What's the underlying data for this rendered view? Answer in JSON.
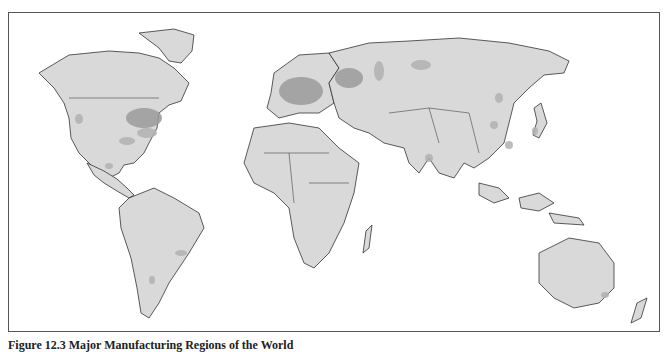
{
  "figure": {
    "caption": "Figure 12.3 Major Manufacturing Regions of the World",
    "type": "world map",
    "colors": {
      "land": "#d9d9d9",
      "manufacturing_major": "#9a9a9a",
      "manufacturing_minor": "#b0b0b0",
      "outline": "#333333",
      "water": "#ffffff"
    }
  },
  "regions": {
    "major": [
      "Northeastern United States / Great Lakes",
      "Western and Central Europe",
      "Central Russia (Moscow region)"
    ],
    "minor": [
      "Southeastern United States",
      "Gulf Coast (Texas)",
      "California coast",
      "Central Mexico",
      "Southeastern Brazil",
      "Buenos Aires region",
      "Ural region",
      "Western Siberia",
      "Northeast China",
      "Eastern China",
      "Southern China",
      "Japan",
      "India",
      "Southeastern Australia",
      "Nile delta"
    ]
  }
}
